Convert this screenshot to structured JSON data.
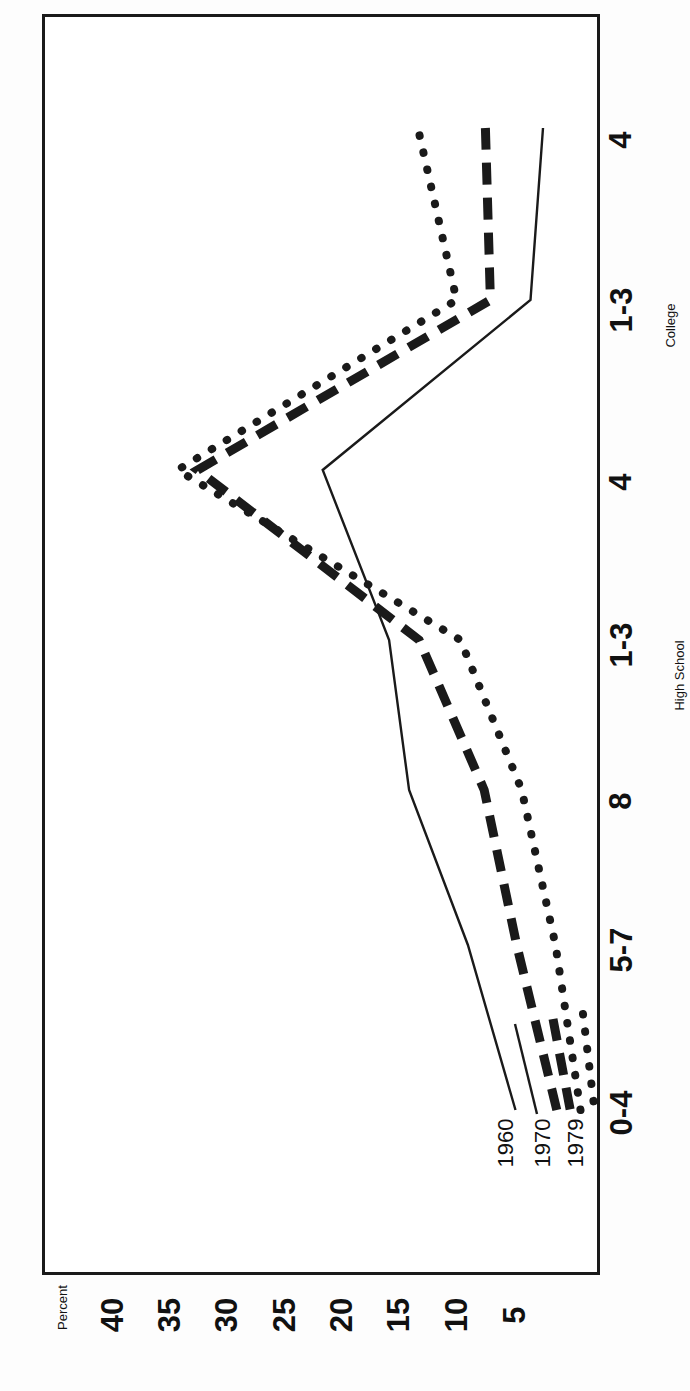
{
  "chart_data": {
    "type": "line",
    "title": "",
    "xlabel": "Years of School Completed",
    "ylabel": "Percent",
    "ylim": [
      0,
      42
    ],
    "grid": false,
    "legend_position": "bottom-left",
    "orientation": "page rotated 90 degrees counter-clockwise",
    "categories": [
      "0-4",
      "5-7",
      "8",
      "1-3",
      "4",
      "1-3",
      "4"
    ],
    "category_groups": [
      {
        "label": "High School",
        "spans": [
          "1-3",
          "4"
        ]
      },
      {
        "label": "College",
        "spans": [
          "1-3",
          "4"
        ]
      }
    ],
    "yticks": [
      40,
      35,
      30,
      25,
      20,
      15,
      10,
      5
    ],
    "series": [
      {
        "name": "1960",
        "style": "solid",
        "values": [
          7.6,
          11.4,
          16.1,
          17.7,
          23.0,
          6.4,
          5.4
        ]
      },
      {
        "name": "1970",
        "style": "dashed",
        "values": [
          4.3,
          7.5,
          10.1,
          15.3,
          33.0,
          9.6,
          10.0
        ]
      },
      {
        "name": "1979",
        "style": "dotted",
        "values": [
          2.4,
          4.4,
          7.1,
          12.0,
          34.6,
          12.3,
          15.4
        ]
      }
    ]
  },
  "axes": {
    "y_title": "Percent",
    "y_ticks": [
      "40",
      "35",
      "30",
      "25",
      "20",
      "15",
      "10",
      "5"
    ],
    "x_title": "Years of School Completed",
    "x_ticks": [
      "0-4",
      "5-7",
      "8",
      "1-3",
      "4",
      "1-3",
      "4"
    ],
    "x_group_high_school": "High School",
    "x_group_college": "College"
  },
  "legend": {
    "items": [
      {
        "label": "1960",
        "style": "solid"
      },
      {
        "label": "1970",
        "style": "dashed"
      },
      {
        "label": "1979",
        "style": "dotted"
      }
    ]
  },
  "colors": {
    "ink": "#1a1a1a",
    "paper": "#ffffff"
  }
}
